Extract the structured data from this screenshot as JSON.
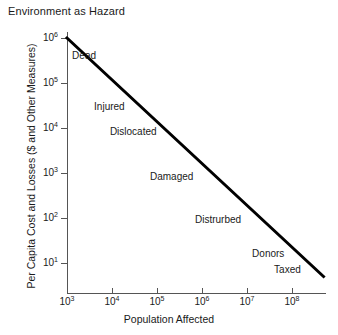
{
  "chart_data": {
    "type": "line",
    "title": "Environment as Hazard",
    "xlabel": "Population Affected",
    "ylabel": "Per Capita Cost and Losses ($ and Other Measures)",
    "xscale": "log",
    "yscale": "log",
    "xlim": [
      1000,
      500000000
    ],
    "ylim": [
      3,
      2000000
    ],
    "grid": false,
    "legend": "none",
    "line_color": "#000000",
    "line_width_px": 3,
    "xticks": [
      {
        "label": "10",
        "exp": "3",
        "value": 1000
      },
      {
        "label": "10",
        "exp": "4",
        "value": 10000
      },
      {
        "label": "10",
        "exp": "5",
        "value": 100000
      },
      {
        "label": "10",
        "exp": "6",
        "value": 1000000
      },
      {
        "label": "10",
        "exp": "7",
        "value": 10000000
      },
      {
        "label": "10",
        "exp": "8",
        "value": 100000000
      }
    ],
    "yticks": [
      {
        "label": "10",
        "exp": "6",
        "value": 1000000
      },
      {
        "label": "10",
        "exp": "5",
        "value": 100000
      },
      {
        "label": "10",
        "exp": "4",
        "value": 10000
      },
      {
        "label": "10",
        "exp": "3",
        "value": 1000
      },
      {
        "label": "10",
        "exp": "2",
        "value": 100
      },
      {
        "label": "10",
        "exp": "1",
        "value": 10
      }
    ],
    "series": [
      {
        "name": "hazard impact tradeoff",
        "points": [
          {
            "x": 1000,
            "y": 1000000
          },
          {
            "x": 500000000,
            "y": 5
          }
        ]
      }
    ],
    "annotations": [
      {
        "text": "Dead",
        "x": 1300,
        "y": 400000
      },
      {
        "text": "Injured",
        "x": 4000,
        "y": 30000
      },
      {
        "text": "Dislocated",
        "x": 9000,
        "y": 8000
      },
      {
        "text": "Damaged",
        "x": 70000,
        "y": 800
      },
      {
        "text": "Distrurbed",
        "x": 700000,
        "y": 90
      },
      {
        "text": "Donors",
        "x": 13000000,
        "y": 16
      },
      {
        "text": "Taxed",
        "x": 40000000,
        "y": 7
      }
    ]
  }
}
